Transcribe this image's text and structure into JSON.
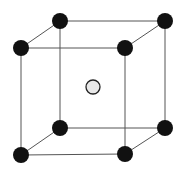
{
  "diagram": {
    "type": "body-centered-cubic-unit-cell",
    "colors": {
      "background": "#ffffff",
      "edge": "#555555",
      "corner_atom": "#111111",
      "center_atom_fill": "#e8e8e8",
      "center_atom_stroke": "#222222"
    },
    "corner_atoms": [
      {
        "id": "back-top-left",
        "x": 60,
        "y": 21,
        "r": 8
      },
      {
        "id": "back-top-right",
        "x": 165,
        "y": 21,
        "r": 8
      },
      {
        "id": "front-top-left",
        "x": 21,
        "y": 48,
        "r": 8
      },
      {
        "id": "front-top-right",
        "x": 125,
        "y": 48,
        "r": 8
      },
      {
        "id": "back-bottom-left",
        "x": 60,
        "y": 128,
        "r": 8
      },
      {
        "id": "back-bottom-right",
        "x": 165,
        "y": 128,
        "r": 8
      },
      {
        "id": "front-bottom-left",
        "x": 21,
        "y": 155,
        "r": 8
      },
      {
        "id": "front-bottom-right",
        "x": 125,
        "y": 154,
        "r": 8
      }
    ],
    "center_atom": {
      "id": "body-center",
      "x": 93,
      "y": 87,
      "r": 7
    }
  }
}
